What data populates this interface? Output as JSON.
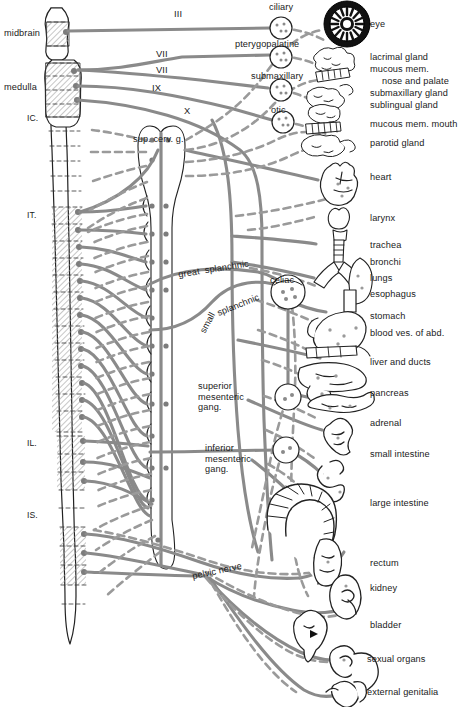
{
  "figure": {
    "type": "anatomical-diagram",
    "background_color": "#ffffff",
    "nerve_line_color": "#8a8a8a",
    "outline_color": "#222222",
    "hatch_color": "#9a9a9a"
  },
  "cns": {
    "regions": [
      {
        "key": "midbrain",
        "label": "midbrain"
      },
      {
        "key": "medulla",
        "label": "medulla"
      }
    ],
    "segment_markers": [
      {
        "key": "c",
        "label": "IC."
      },
      {
        "key": "t",
        "label": "IT."
      },
      {
        "key": "l",
        "label": "IL."
      },
      {
        "key": "s",
        "label": "IS."
      }
    ]
  },
  "cranial_nerves": [
    {
      "label": "III"
    },
    {
      "label": "VII"
    },
    {
      "label": "VII"
    },
    {
      "label": "IX"
    },
    {
      "label": "X"
    }
  ],
  "ganglia": [
    {
      "key": "ciliary",
      "label": "ciliary"
    },
    {
      "key": "pterygopalatine",
      "label": "pterygopalatine"
    },
    {
      "key": "submaxillary",
      "label": "submaxillary"
    },
    {
      "key": "otic",
      "label": "otic"
    },
    {
      "key": "sup_cerv",
      "label": "sup. cerv. g."
    },
    {
      "key": "celiac",
      "label": "celiac"
    },
    {
      "key": "sup_mesenteric",
      "label": "superior\nmesenteric\ngang."
    },
    {
      "key": "inf_mesenteric",
      "label": "inferior\nmesenteric\ngang."
    }
  ],
  "nerve_labels": [
    {
      "key": "great_splanchnic",
      "label": "great  splanchnic"
    },
    {
      "key": "small",
      "label": "small"
    },
    {
      "key": "splanchnic",
      "label": "splanchnic"
    },
    {
      "key": "pelvic_nerve",
      "label": "pelvic nerve"
    }
  ],
  "organs": [
    {
      "key": "eye",
      "label": "eye"
    },
    {
      "key": "lacrimal",
      "label": "lacrimal gland"
    },
    {
      "key": "mucous_mem",
      "label": "mucous mem."
    },
    {
      "key": "nose_palate",
      "label": "nose and palate"
    },
    {
      "key": "submaxillary_gland",
      "label": "submaxillary gland"
    },
    {
      "key": "sublingual_gland",
      "label": "sublingual gland"
    },
    {
      "key": "mucous_mem_mouth",
      "label": "mucous mem. mouth"
    },
    {
      "key": "parotid_gland",
      "label": "parotid gland"
    },
    {
      "key": "heart",
      "label": "heart"
    },
    {
      "key": "larynx",
      "label": "larynx"
    },
    {
      "key": "trachea",
      "label": "trachea"
    },
    {
      "key": "bronchi",
      "label": "bronchi"
    },
    {
      "key": "lungs",
      "label": "lungs"
    },
    {
      "key": "esophagus",
      "label": "esophagus"
    },
    {
      "key": "stomach",
      "label": "stomach"
    },
    {
      "key": "blood_ves_abd",
      "label": "blood ves. of abd."
    },
    {
      "key": "liver_ducts",
      "label": "liver and ducts"
    },
    {
      "key": "pancreas",
      "label": "pancreas"
    },
    {
      "key": "adrenal",
      "label": "adrenal"
    },
    {
      "key": "small_intestine",
      "label": "small intestine"
    },
    {
      "key": "large_intestine",
      "label": "large intestine"
    },
    {
      "key": "rectum",
      "label": "rectum"
    },
    {
      "key": "kidney",
      "label": "kidney"
    },
    {
      "key": "bladder",
      "label": "bladder"
    },
    {
      "key": "sexual_organs",
      "label": "sexual organs"
    },
    {
      "key": "external_genitalia",
      "label": "external genitalia"
    }
  ]
}
